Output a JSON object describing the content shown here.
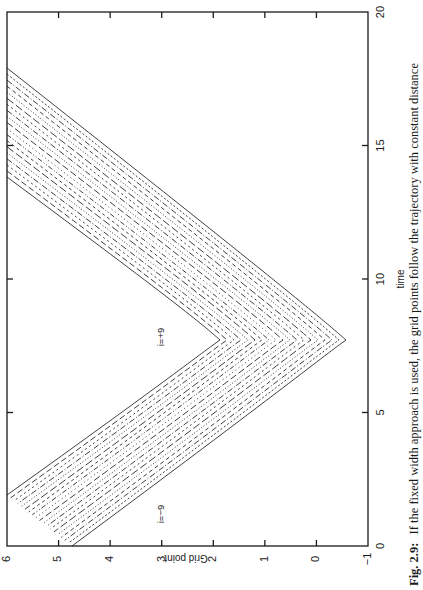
{
  "chart_data": {
    "type": "line",
    "orientation": "rotated-90-ccw",
    "title": "",
    "xlabel": "time",
    "ylabel": "Grid point",
    "xlim": [
      0,
      20
    ],
    "ylim": [
      -1,
      6
    ],
    "xticks": [
      0,
      5,
      10,
      15,
      20
    ],
    "xtick_labels": [
      "0",
      "5",
      "10",
      "15",
      "20"
    ],
    "yticks": [
      -1,
      0,
      1,
      2,
      3,
      4,
      5,
      6
    ],
    "ytick_labels": [
      "−1",
      "0",
      "1",
      "2",
      "3",
      "4",
      "5",
      "6"
    ],
    "grid": false,
    "legend": null,
    "annotations": [
      {
        "text": "i=−9",
        "t": 1.0,
        "grid": 3.0
      },
      {
        "text": "i=+9",
        "t": 7.8,
        "grid": 3.0
      }
    ],
    "series": [
      {
        "name": "i=+9 (inner envelope, solid)",
        "style": "solid",
        "points": [
          [
            1.9,
            6.0
          ],
          [
            4.0,
            4.4
          ],
          [
            6.5,
            2.7
          ],
          [
            7.7,
            1.87
          ],
          [
            9.0,
            2.9
          ],
          [
            11.0,
            4.3
          ],
          [
            13.8,
            6.0
          ]
        ]
      },
      {
        "name": "i=-9 (outer envelope, solid)",
        "style": "solid",
        "points": [
          [
            0.0,
            4.75
          ],
          [
            3.0,
            2.5
          ],
          [
            6.2,
            0.4
          ],
          [
            7.7,
            -0.57
          ],
          [
            9.5,
            0.8
          ],
          [
            12.0,
            2.6
          ],
          [
            14.0,
            3.9
          ],
          [
            17.9,
            6.0
          ]
        ]
      }
    ],
    "vertex": {
      "t": 7.7,
      "grid_inner": 1.87,
      "grid_outer": -0.57
    },
    "line_count": 19
  },
  "caption": {
    "label": "Fig. 2.9:",
    "text": "If the fixed width approach is used, the grid points follow the trajectory with constant distance"
  }
}
